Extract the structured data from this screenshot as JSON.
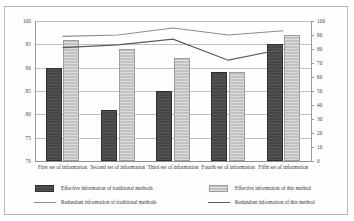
{
  "chart_data": {
    "type": "bar",
    "title": "",
    "subtitle": "",
    "xlabel": "",
    "ylabel": "",
    "grid": true,
    "legend_position": "bottom",
    "categories": [
      "First set of information",
      "Second set of information",
      "Third set of information",
      "Fourth set of information",
      "Fifth set of information"
    ],
    "axes": {
      "left": {
        "label": "",
        "ylim": [
          70,
          100
        ],
        "step": 5,
        "ticks": [
          "70",
          "75",
          "80",
          "85",
          "90",
          "95",
          "100"
        ],
        "applies_to": [
          "Effective information of traditional methods",
          "Effective information of this method"
        ]
      },
      "right": {
        "label": "",
        "ylim": [
          0,
          100
        ],
        "step": 10,
        "ticks": [
          "0",
          "10",
          "20",
          "30",
          "40",
          "50",
          "60",
          "70",
          "80",
          "90",
          "100"
        ],
        "applies_to": [
          "Redundant information of traditional methods",
          "Redundant information of this method"
        ]
      }
    },
    "series": [
      {
        "name": "Effective information of traditional methods",
        "kind": "bar",
        "axis": "left",
        "color": "#474747",
        "values": [
          90,
          81,
          85,
          89,
          95
        ]
      },
      {
        "name": "Effective information of this method",
        "kind": "bar",
        "axis": "left",
        "color": "#c2c2c2",
        "values": [
          96,
          94,
          92,
          89,
          97
        ]
      },
      {
        "name": "Redundant information of traditional methods",
        "kind": "line",
        "axis": "right",
        "color": "#8c8c8c",
        "values": [
          89,
          90,
          95,
          90,
          93
        ]
      },
      {
        "name": "Redundant information of this method",
        "kind": "line",
        "axis": "right",
        "color": "#5a5a5a",
        "values": [
          81,
          83,
          87,
          72,
          80
        ]
      }
    ]
  },
  "legend": {
    "items": [
      {
        "label": "Effective information of traditional methods",
        "marker": "square-dark"
      },
      {
        "label": "Effective information of this method",
        "marker": "square-light"
      },
      {
        "label": "Redundant information of traditional methods",
        "marker": "line-dark"
      },
      {
        "label": "Redundant information of this method",
        "marker": "line-mid"
      }
    ]
  }
}
